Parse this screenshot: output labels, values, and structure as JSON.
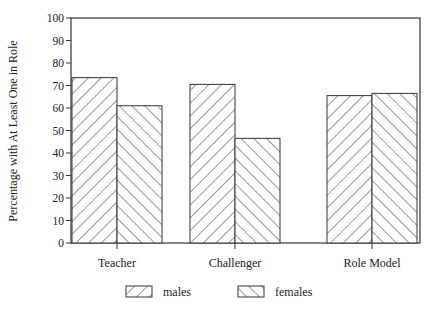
{
  "chart_data": {
    "type": "bar",
    "title": "",
    "xlabel": "",
    "ylabel": "Percentage with At Least One in Role",
    "ylim": [
      0,
      100
    ],
    "yticks": [
      0,
      10,
      20,
      30,
      40,
      50,
      60,
      70,
      80,
      90,
      100
    ],
    "grid": false,
    "legend_position": "bottom",
    "categories": [
      "Teacher",
      "Challenger",
      "Role Model"
    ],
    "series": [
      {
        "name": "males",
        "pattern": "forward-diagonal-hatch",
        "values": [
          73.5,
          70.5,
          65.5
        ]
      },
      {
        "name": "females",
        "pattern": "backward-diagonal-hatch",
        "values": [
          61,
          46.5,
          66.5
        ]
      }
    ]
  },
  "colors": {
    "line": "#333333",
    "background": "#ffffff"
  }
}
